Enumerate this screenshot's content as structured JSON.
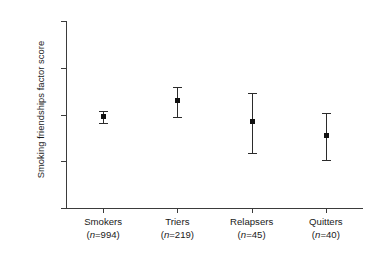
{
  "chart_data": {
    "type": "scatter",
    "title": "",
    "xlabel": "",
    "ylabel": "Smoking friendships factor score",
    "ylim": [
      -1.0,
      1.0
    ],
    "grid": false,
    "legend": "none",
    "ytick_labels": [
      "1.0",
      "0.5",
      "0.0",
      "-0.5",
      "-1.0"
    ],
    "ytick_values": [
      1.0,
      0.5,
      0.0,
      -0.5,
      -1.0
    ],
    "categories": [
      "Smokers",
      "Triers",
      "Relapsers",
      "Quitters"
    ],
    "group_labels": [
      {
        "name": "Smokers",
        "n_text": "(n=994)",
        "n": 994
      },
      {
        "name": "Triers",
        "n_text": "(n=219)",
        "n": 219
      },
      {
        "name": "Relapsers",
        "n_text": "(n=45)",
        "n": 45
      },
      {
        "name": "Quitters",
        "n_text": "(n=40)",
        "n": 40
      }
    ],
    "values": [
      -0.02,
      0.16,
      -0.07,
      -0.22
    ],
    "error_low": [
      -0.09,
      -0.03,
      -0.41,
      -0.49
    ],
    "error_high": [
      0.04,
      0.29,
      0.23,
      0.02
    ],
    "series": [
      {
        "name": "Smoking friendships factor score",
        "points": [
          {
            "category": "Smokers",
            "value": -0.02,
            "ci_low": -0.09,
            "ci_high": 0.04
          },
          {
            "category": "Triers",
            "value": 0.16,
            "ci_low": -0.03,
            "ci_high": 0.29
          },
          {
            "category": "Relapsers",
            "value": -0.07,
            "ci_low": -0.41,
            "ci_high": 0.23
          },
          {
            "category": "Quitters",
            "value": -0.22,
            "ci_low": -0.49,
            "ci_high": 0.02
          }
        ]
      }
    ],
    "colors": {
      "marker": "#111111",
      "axis": "#3b3b3b",
      "background": "#ffffff"
    }
  },
  "axis": {
    "y_title": "Smoking friendships factor score"
  }
}
